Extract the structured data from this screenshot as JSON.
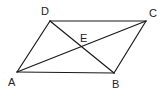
{
  "diagram": {
    "type": "geometry",
    "shape": "parallelogram",
    "stroke_color": "#1a1a1a",
    "background": "#ffffff",
    "points": {
      "A": {
        "label": "A",
        "x": 17,
        "y": 72,
        "lx": 8,
        "ly": 86
      },
      "B": {
        "label": "B",
        "x": 114,
        "y": 73,
        "lx": 112,
        "ly": 88
      },
      "C": {
        "label": "C",
        "x": 146,
        "y": 21,
        "lx": 149,
        "ly": 17
      },
      "D": {
        "label": "D",
        "x": 50,
        "y": 21,
        "lx": 41,
        "ly": 15
      },
      "E": {
        "label": "E",
        "x": 82,
        "y": 47,
        "lx": 80,
        "ly": 42
      }
    },
    "segments": [
      {
        "name": "side-AB",
        "from": "A",
        "to": "B"
      },
      {
        "name": "side-BC",
        "from": "B",
        "to": "C"
      },
      {
        "name": "side-CD",
        "from": "C",
        "to": "D"
      },
      {
        "name": "side-DA",
        "from": "D",
        "to": "A"
      },
      {
        "name": "diagonal-AC",
        "from": "A",
        "to": "C"
      },
      {
        "name": "diagonal-DB",
        "from": "D",
        "to": "B"
      }
    ]
  }
}
